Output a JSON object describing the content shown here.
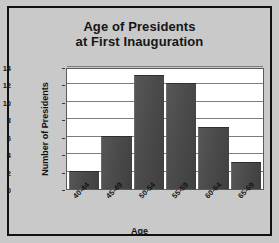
{
  "chart_data": {
    "type": "bar",
    "title": "Age of Presidents at First Inauguration",
    "title_line1": "Age of Presidents",
    "title_line2": "at First Inauguration",
    "categories": [
      "40-44",
      "45-49",
      "50-54",
      "55-59",
      "60-64",
      "65-69"
    ],
    "values": [
      2,
      6,
      13,
      12,
      7,
      3
    ],
    "xlabel": "Age",
    "ylabel": "Number of Presidents",
    "ylim": [
      0,
      14
    ],
    "ytick_values": [
      0,
      2,
      4,
      6,
      8,
      10,
      12,
      14
    ],
    "ytick_labels": [
      "0",
      "2",
      "4",
      "6",
      "8",
      "10",
      "12",
      "14"
    ],
    "grid": true,
    "grid_axis": "y",
    "legend": false,
    "bar_color": "#4b4b4b",
    "plot_background": "#ffffff",
    "figure_background": "#c9c9c9",
    "border_color": "#111111"
  }
}
